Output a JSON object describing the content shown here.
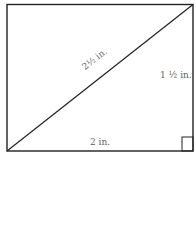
{
  "diagram": {
    "shape": "rectangle",
    "labels": {
      "diagonal": "2½ in.",
      "height": "1 ½ in.",
      "width": "2 in."
    },
    "right_angle_marker": "bottom-right",
    "colors": {
      "stroke": "#222222",
      "text": "#666666",
      "background": "#ffffff"
    }
  }
}
